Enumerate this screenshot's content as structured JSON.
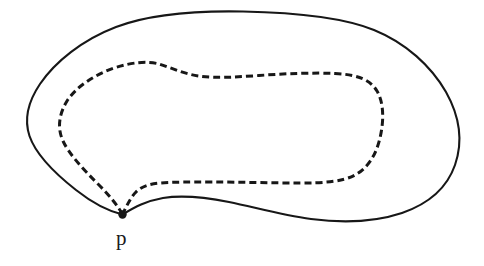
{
  "figure": {
    "background_color": "#ffffff",
    "stroke_color": "#171717",
    "outer_curve": {
      "name": "outer-solid-closed-curve",
      "style": "solid",
      "stroke_width": 2.1,
      "path": "M 122.5 214.5 C 112 212 95 205 76 190 C 55 173.5 36 155 29.5 136 C 23.5 118 28.5 101 40 84 C 55 62 82 40 116 27 C 150 14 193 10.5 243 11.5 C 295 12.5 342 17 374 30 C 406 43 431 66 446 92 C 460 117 463 142 455 165 C 447 188 428 204 402 213 C 375 222 342 223 311 219 C 281 215 254 207 229 202 C 204 197 181 195 163 198 C 146 201 135 207 122.5 214.5 Z"
    },
    "inner_curve": {
      "name": "inner-dashed-closed-curve",
      "style": "dashed",
      "stroke_width": 3.0,
      "dash_array": "7 4",
      "path": "M 122.5 214.5 C 118 206 110 196 98 184 C 83 169 69 154 63 141 C 57 128 59 114 67 101 C 76 87 94 75 114 68 C 132 62 148 61 159 64 C 172 68 184 74 199 76 C 216 78.5 237 77 259 75.5 C 286 73.5 314 72.5 335 73.5 C 356 74.5 370 79 377 91 C 384 103 384 121 380 138 C 376 155 368 168 355 175 C 342 182 323 183 300 183 C 272 183 240 182 212 182 C 190 182 172 182 160 183 C 148 184 141 187 136 192 C 131 197 127 205 122.5 214.5 Z"
    },
    "vertex_point": {
      "name": "vertex-point-p",
      "x": 122.5,
      "y": 214.5,
      "radius": 4.2
    },
    "label": {
      "name": "label-p",
      "text": "p",
      "x": 116,
      "y": 228,
      "font_size_px": 21
    }
  }
}
